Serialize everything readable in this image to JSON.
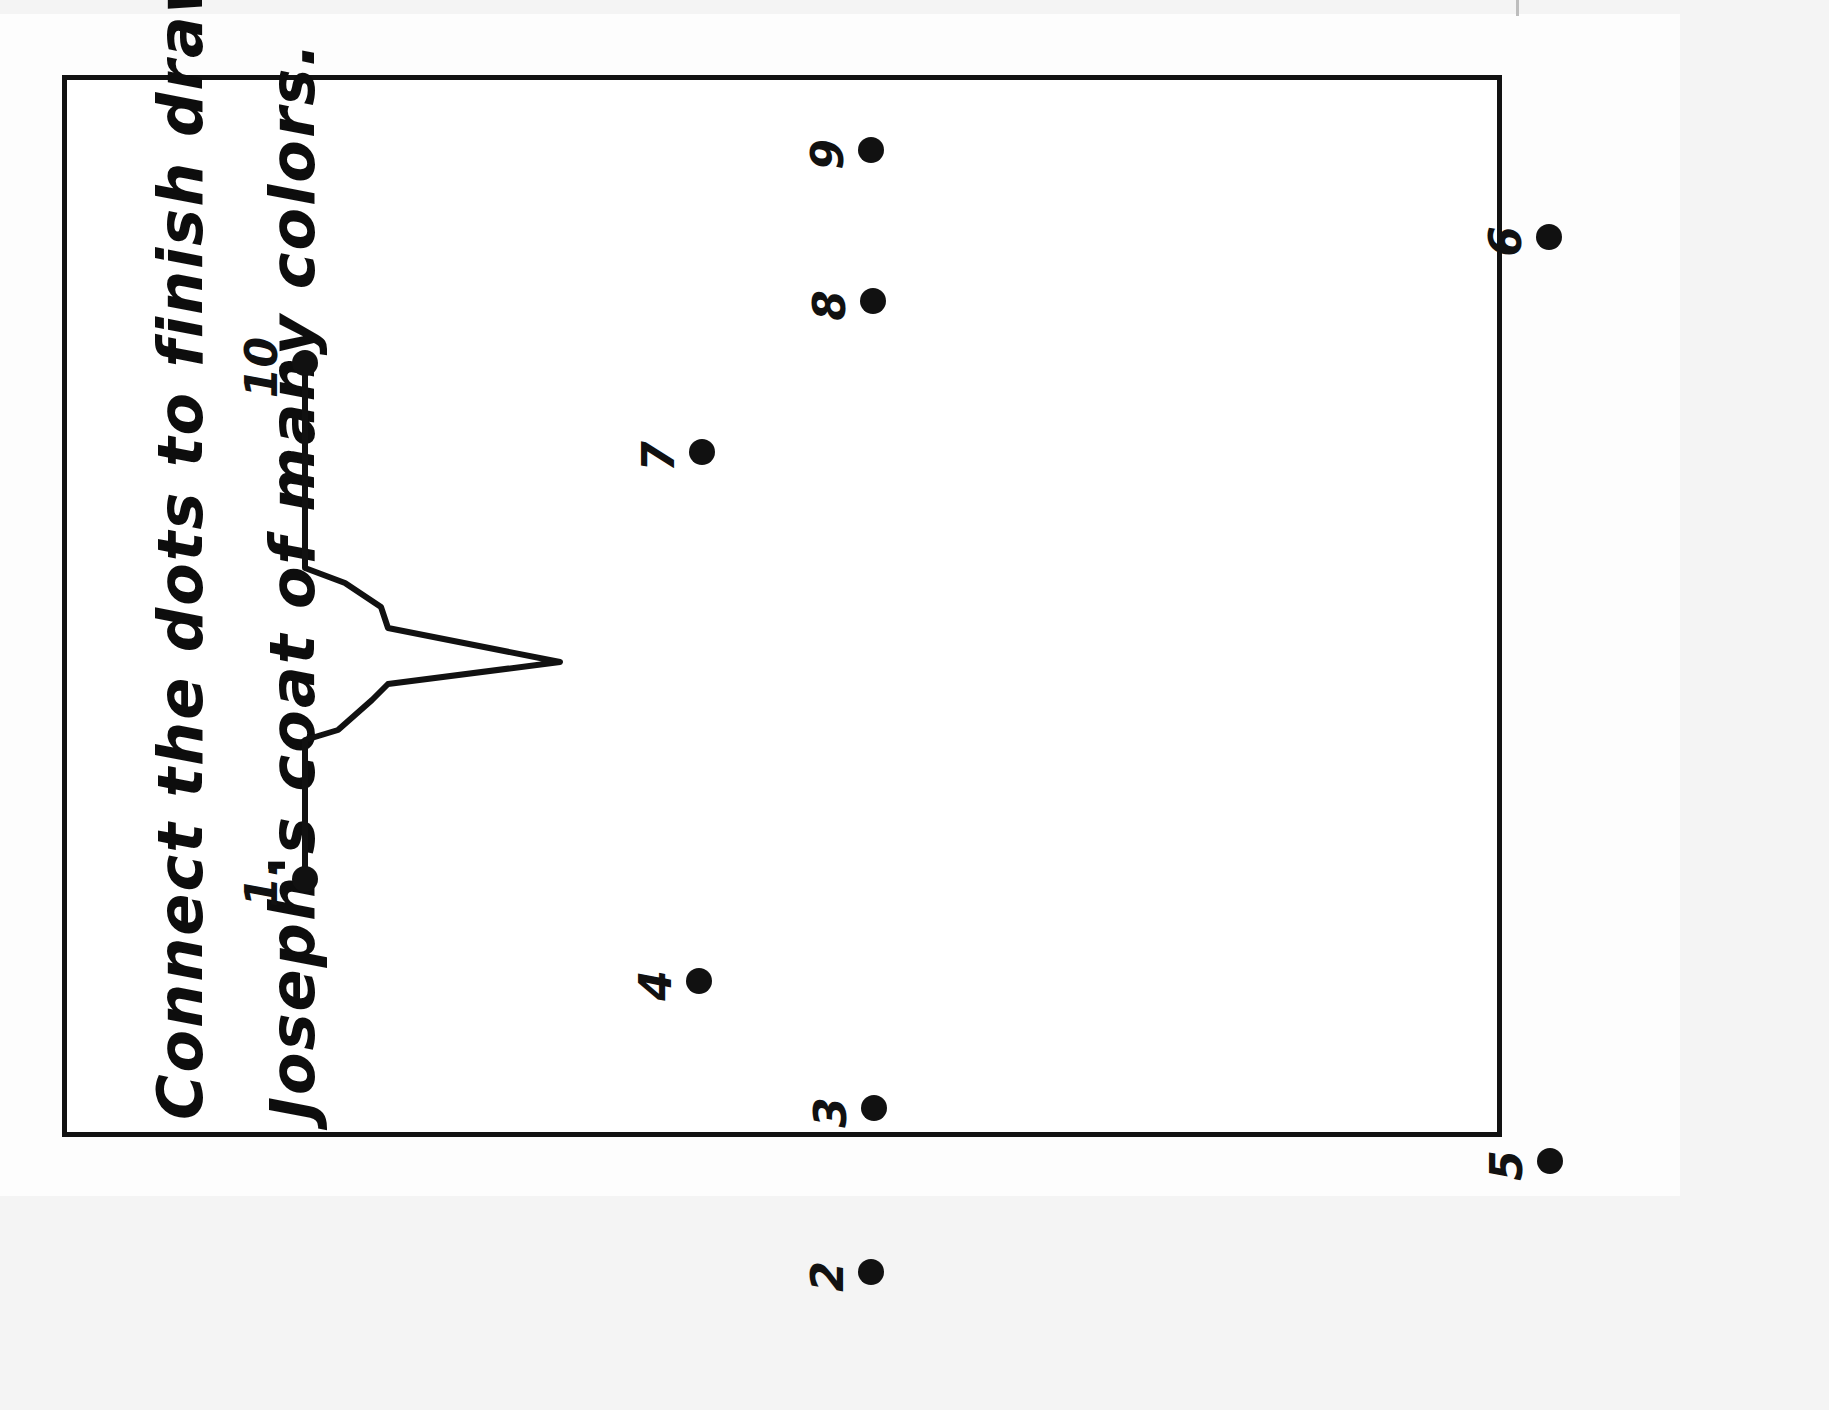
{
  "document": {
    "type": "connect-the-dots worksheet",
    "orientation": "rotated-90-ccw",
    "background_color": "#ffffff",
    "ink_color": "#111111"
  },
  "instructions": {
    "line1": "Connect the dots to finish drawing",
    "line2": "Joseph's coat of many colors.",
    "full_text": "Connect the dots to finish drawing Joseph's coat of many colors."
  },
  "frame": {
    "name": "worksheet-border",
    "stroke_color": "#121212",
    "stroke_width": 5
  },
  "dots": [
    {
      "label": "1.",
      "x": 305,
      "y": 879
    },
    {
      "label": "2",
      "x": 871,
      "y": 1272
    },
    {
      "label": "3",
      "x": 874,
      "y": 1108
    },
    {
      "label": "4",
      "x": 699,
      "y": 981
    },
    {
      "label": "5",
      "x": 1550,
      "y": 1161
    },
    {
      "label": "6",
      "x": 1549,
      "y": 237
    },
    {
      "label": "7",
      "x": 702,
      "y": 452
    },
    {
      "label": "8",
      "x": 873,
      "y": 301
    },
    {
      "label": "9",
      "x": 871,
      "y": 150
    },
    {
      "label": "10",
      "x": 305,
      "y": 363
    }
  ],
  "partial_drawing": {
    "name": "coat-collar-outline",
    "description": "Pointed collar / lapel outline already drawn between dot 1 and dot 10",
    "stroke_color": "#111111",
    "stroke_width": 6,
    "points": [
      [
        305,
        363
      ],
      [
        305,
        568
      ],
      [
        345,
        583
      ],
      [
        381,
        607
      ],
      [
        388,
        628
      ],
      [
        560,
        662
      ],
      [
        388,
        684
      ],
      [
        372,
        700
      ],
      [
        338,
        730
      ],
      [
        305,
        740
      ],
      [
        305,
        879
      ]
    ]
  }
}
